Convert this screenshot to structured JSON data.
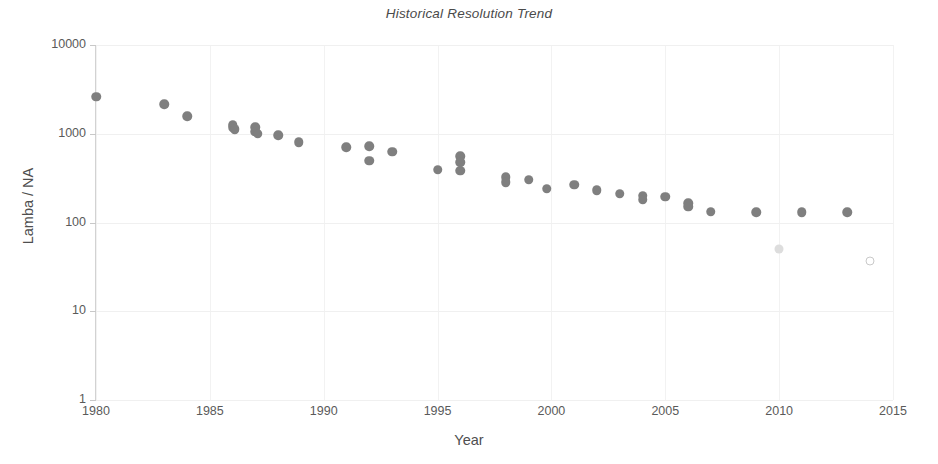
{
  "chart_data": {
    "type": "scatter",
    "title": "Historical Resolution Trend",
    "xlabel": "Year",
    "ylabel": "Lamba / NA",
    "xlim": [
      1980,
      2015
    ],
    "ylim": [
      1,
      10000
    ],
    "yscale": "log",
    "grid": true,
    "legend": "none",
    "x_ticks": [
      "1980",
      "1985",
      "1990",
      "1995",
      "2000",
      "2005",
      "2010",
      "2015"
    ],
    "x_tick_values": [
      1980,
      1985,
      1990,
      1995,
      2000,
      2005,
      2010,
      2015
    ],
    "y_ticks": [
      "1",
      "10",
      "100",
      "1000",
      "10000"
    ],
    "y_tick_values": [
      1,
      10,
      100,
      1000,
      10000
    ],
    "series": [
      {
        "name": "Production tools",
        "marker": "solid",
        "color": "#7f7f7f",
        "points": [
          {
            "x": 1980.0,
            "y": 2600
          },
          {
            "x": 1983.0,
            "y": 2150
          },
          {
            "x": 1984.0,
            "y": 1580
          },
          {
            "x": 1986.0,
            "y": 1270
          },
          {
            "x": 1986.0,
            "y": 1180
          },
          {
            "x": 1986.1,
            "y": 1120
          },
          {
            "x": 1987.0,
            "y": 1180
          },
          {
            "x": 1987.0,
            "y": 1060
          },
          {
            "x": 1987.1,
            "y": 1000
          },
          {
            "x": 1988.0,
            "y": 960
          },
          {
            "x": 1988.9,
            "y": 800
          },
          {
            "x": 1991.0,
            "y": 700
          },
          {
            "x": 1992.0,
            "y": 720
          },
          {
            "x": 1992.0,
            "y": 495
          },
          {
            "x": 1993.0,
            "y": 630
          },
          {
            "x": 1995.0,
            "y": 395
          },
          {
            "x": 1996.0,
            "y": 560
          },
          {
            "x": 1996.0,
            "y": 480
          },
          {
            "x": 1996.0,
            "y": 385
          },
          {
            "x": 1998.0,
            "y": 325
          },
          {
            "x": 1998.0,
            "y": 285
          },
          {
            "x": 1999.0,
            "y": 305
          },
          {
            "x": 1999.8,
            "y": 240
          },
          {
            "x": 2001.0,
            "y": 265
          },
          {
            "x": 2002.0,
            "y": 230
          },
          {
            "x": 2003.0,
            "y": 210
          },
          {
            "x": 2004.0,
            "y": 200
          },
          {
            "x": 2004.0,
            "y": 180
          },
          {
            "x": 2005.0,
            "y": 195
          },
          {
            "x": 2006.0,
            "y": 165
          },
          {
            "x": 2006.0,
            "y": 150
          },
          {
            "x": 2007.0,
            "y": 133
          },
          {
            "x": 2009.0,
            "y": 131
          },
          {
            "x": 2011.0,
            "y": 131
          },
          {
            "x": 2013.0,
            "y": 131
          }
        ]
      },
      {
        "name": "Projected / EUV",
        "marker": "faint",
        "color": "#dddddd",
        "points": [
          {
            "x": 2010.0,
            "y": 50
          }
        ]
      },
      {
        "name": "Projected outlier",
        "marker": "hollow",
        "color": "#c9c9c9",
        "points": [
          {
            "x": 2014.0,
            "y": 37
          }
        ]
      }
    ]
  }
}
